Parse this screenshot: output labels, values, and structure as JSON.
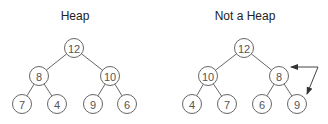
{
  "diagrams": [
    {
      "title": "Heap",
      "nodes": [
        {
          "id": "a",
          "value": "12",
          "x": 74,
          "y": 48
        },
        {
          "id": "b",
          "value": "8",
          "x": 39,
          "y": 76
        },
        {
          "id": "c",
          "value": "10",
          "x": 110,
          "y": 76
        },
        {
          "id": "d",
          "value": "7",
          "x": 22,
          "y": 104
        },
        {
          "id": "e",
          "value": "4",
          "x": 57,
          "y": 104
        },
        {
          "id": "f",
          "value": "9",
          "x": 93,
          "y": 104
        },
        {
          "id": "g",
          "value": "6",
          "x": 127,
          "y": 104
        }
      ],
      "edges": [
        [
          "a",
          "b"
        ],
        [
          "a",
          "c"
        ],
        [
          "b",
          "d"
        ],
        [
          "b",
          "e"
        ],
        [
          "c",
          "f"
        ],
        [
          "c",
          "g"
        ]
      ]
    },
    {
      "title": "Not a Heap",
      "nodes": [
        {
          "id": "a",
          "value": "12",
          "x": 244,
          "y": 48
        },
        {
          "id": "b",
          "value": "10",
          "x": 208,
          "y": 76
        },
        {
          "id": "c",
          "value": "8",
          "x": 279,
          "y": 76
        },
        {
          "id": "d",
          "value": "4",
          "x": 192,
          "y": 104
        },
        {
          "id": "e",
          "value": "7",
          "x": 227,
          "y": 104
        },
        {
          "id": "f",
          "value": "6",
          "x": 262,
          "y": 104
        },
        {
          "id": "g",
          "value": "9",
          "x": 297,
          "y": 104
        }
      ],
      "edges": [
        [
          "a",
          "b"
        ],
        [
          "a",
          "c"
        ],
        [
          "b",
          "d"
        ],
        [
          "b",
          "e"
        ],
        [
          "c",
          "f"
        ],
        [
          "c",
          "g"
        ]
      ],
      "swap_arrow": {
        "between": [
          "8",
          "9"
        ]
      }
    }
  ]
}
